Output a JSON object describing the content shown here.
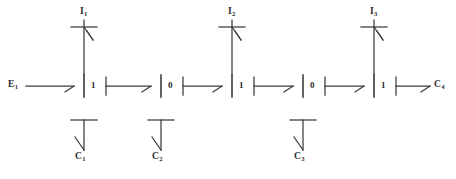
{
  "diagram": {
    "background": "#ffffff",
    "stroke_color": "#3a3a3a",
    "text_color": "#2b2b2b",
    "width": 456,
    "height": 179,
    "input_label": {
      "base": "E",
      "sub": "1"
    },
    "output_label": {
      "base": "C",
      "sub": "4"
    },
    "top_inputs": [
      {
        "base": "I",
        "sub": "1"
      },
      {
        "base": "I",
        "sub": "2"
      },
      {
        "base": "I",
        "sub": "3"
      }
    ],
    "bottom_outputs": [
      {
        "base": "C",
        "sub": "1"
      },
      {
        "base": "C",
        "sub": "2"
      },
      {
        "base": "C",
        "sub": "3"
      }
    ],
    "nodes": [
      {
        "value": "1",
        "x": 84,
        "has_top_input": true,
        "has_bottom_output": true
      },
      {
        "value": "0",
        "x": 161,
        "has_top_input": false,
        "has_bottom_output": true
      },
      {
        "value": "1",
        "x": 232,
        "has_top_input": true,
        "has_bottom_output": false
      },
      {
        "value": "0",
        "x": 303,
        "has_top_input": false,
        "has_bottom_output": true
      },
      {
        "value": "1",
        "x": 374,
        "has_top_input": true,
        "has_bottom_output": false
      }
    ]
  }
}
